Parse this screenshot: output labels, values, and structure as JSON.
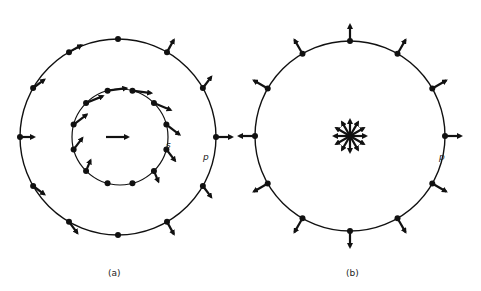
{
  "figure": {
    "panels": [
      {
        "id": "a",
        "caption": "(a)",
        "outer_circle": {
          "cx": 118,
          "cy": 137,
          "r": 98,
          "point_count": 12,
          "point_label": "p",
          "arrows": "uniform translation plus local rotation"
        },
        "inner_circle": {
          "cx": 120,
          "cy": 137,
          "r": 48,
          "point_count": 12,
          "point_label": "s",
          "arrows": "tangential"
        },
        "center_arrow": {
          "direction": "right"
        }
      },
      {
        "id": "b",
        "caption": "(b)",
        "circle": {
          "cx": 350,
          "cy": 136,
          "r": 95,
          "point_count": 12,
          "point_label": "p",
          "arrows": "radial outward"
        },
        "center_star": {
          "arrow_count": 12
        }
      }
    ],
    "colors": {
      "ink": "#111111",
      "background": "#ffffff"
    }
  }
}
